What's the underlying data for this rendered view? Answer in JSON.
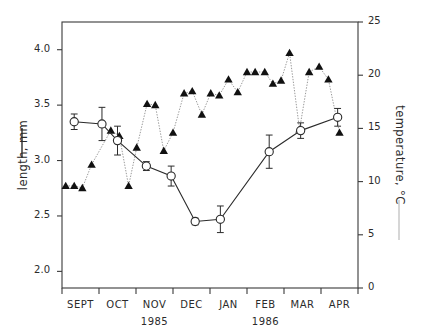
{
  "chart_data": {
    "type": "line",
    "title": "",
    "subtitle": "",
    "xlabel": "",
    "ylabel": "length, mm",
    "y2label": "temperature, °C",
    "ylim": [
      1.85,
      4.25
    ],
    "y2lim": [
      0,
      25
    ],
    "xlim": [
      0,
      8
    ],
    "grid": false,
    "legend_position": "axis-labels",
    "x_tick_labels": [
      "SEPT",
      "OCT",
      "NOV",
      "DEC",
      "JAN",
      "FEB",
      "MAR",
      "APR"
    ],
    "x_tick_positions": [
      0.5,
      1.5,
      2.5,
      3.5,
      4.5,
      5.5,
      6.5,
      7.5
    ],
    "x_major_tick_positions": [
      0,
      1,
      2,
      3,
      4,
      5,
      6,
      7,
      8
    ],
    "y_tick_labels": [
      "2.0",
      "2.5",
      "3.0",
      "3.5",
      "4.0"
    ],
    "y_tick_values": [
      2.0,
      2.5,
      3.0,
      3.5,
      4.0
    ],
    "y2_tick_labels": [
      "0",
      "5",
      "10",
      "15",
      "20",
      "25"
    ],
    "y2_tick_values": [
      0,
      5,
      10,
      15,
      20,
      25
    ],
    "year_annotations": [
      {
        "text": "1985",
        "x": 2.5
      },
      {
        "text": "1986",
        "x": 5.5
      }
    ],
    "series": [
      {
        "name": "length, mm",
        "axis": "left",
        "marker": "open-circle",
        "line_style": "solid",
        "color": "#2b2b2b",
        "has_error_bars": true,
        "points": [
          {
            "x": 0.33,
            "y": 3.35,
            "err": 0.07
          },
          {
            "x": 1.08,
            "y": 3.33,
            "err": 0.15
          },
          {
            "x": 1.5,
            "y": 3.18,
            "err": 0.13
          },
          {
            "x": 2.28,
            "y": 2.95,
            "err": 0.04
          },
          {
            "x": 2.95,
            "y": 2.86,
            "err": 0.09
          },
          {
            "x": 3.6,
            "y": 2.45,
            "err": 0.03
          },
          {
            "x": 4.28,
            "y": 2.47,
            "err": 0.12
          },
          {
            "x": 5.6,
            "y": 3.08,
            "err": 0.15
          },
          {
            "x": 6.45,
            "y": 3.27,
            "err": 0.07
          },
          {
            "x": 7.45,
            "y": 3.39,
            "err": 0.08
          }
        ]
      },
      {
        "name": "temperature, °C",
        "axis": "right",
        "marker": "filled-triangle",
        "line_style": "dotted",
        "color": "#111111",
        "has_error_bars": false,
        "points": [
          {
            "x": 0.1,
            "y": 9.6
          },
          {
            "x": 0.33,
            "y": 9.6
          },
          {
            "x": 0.55,
            "y": 9.4
          },
          {
            "x": 0.8,
            "y": 11.6
          },
          {
            "x": 1.32,
            "y": 14.8
          },
          {
            "x": 1.55,
            "y": 14.3
          },
          {
            "x": 1.8,
            "y": 9.6
          },
          {
            "x": 2.02,
            "y": 13.2
          },
          {
            "x": 2.3,
            "y": 17.3
          },
          {
            "x": 2.52,
            "y": 17.2
          },
          {
            "x": 2.75,
            "y": 12.9
          },
          {
            "x": 3.0,
            "y": 14.6
          },
          {
            "x": 3.3,
            "y": 18.3
          },
          {
            "x": 3.52,
            "y": 18.5
          },
          {
            "x": 3.78,
            "y": 16.3
          },
          {
            "x": 4.02,
            "y": 18.3
          },
          {
            "x": 4.25,
            "y": 18.1
          },
          {
            "x": 4.5,
            "y": 19.6
          },
          {
            "x": 4.75,
            "y": 18.4
          },
          {
            "x": 5.0,
            "y": 20.3
          },
          {
            "x": 5.22,
            "y": 20.3
          },
          {
            "x": 5.48,
            "y": 20.3
          },
          {
            "x": 5.7,
            "y": 19.2
          },
          {
            "x": 5.92,
            "y": 19.5
          },
          {
            "x": 6.15,
            "y": 22.1
          },
          {
            "x": 6.42,
            "y": 14.9
          },
          {
            "x": 6.68,
            "y": 20.3
          },
          {
            "x": 6.95,
            "y": 20.8
          },
          {
            "x": 7.2,
            "y": 19.6
          },
          {
            "x": 7.5,
            "y": 14.6
          }
        ]
      }
    ]
  }
}
